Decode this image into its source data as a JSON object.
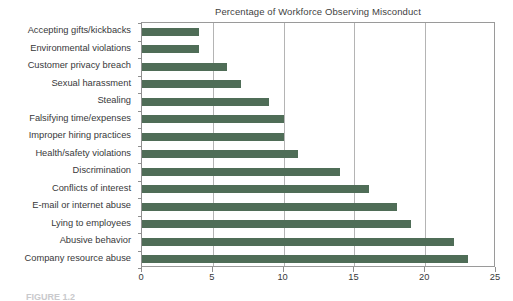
{
  "chart_data": {
    "type": "bar",
    "orientation": "horizontal",
    "title": "Percentage of Workforce Observing Misconduct",
    "xlabel": "",
    "ylabel": "",
    "xlim": [
      0,
      25
    ],
    "xticks": [
      0,
      5,
      10,
      15,
      20,
      25
    ],
    "xtick_labels": [
      "0",
      "5",
      "10",
      "15",
      "20",
      "25"
    ],
    "grid": "vertical",
    "legend": "none",
    "bar_color": "#4f6d57",
    "categories": [
      "Accepting gifts/kickbacks",
      "Environmental violations",
      "Customer privacy breach",
      "Sexual harassment",
      "Stealing",
      "Falsifying time/expenses",
      "Improper hiring practices",
      "Health/safety violations",
      "Discrimination",
      "Conflicts of interest",
      "E-mail or internet abuse",
      "Lying to employees",
      "Abusive behavior",
      "Company resource abuse"
    ],
    "values": [
      4,
      4,
      6,
      7,
      9,
      10,
      10,
      11,
      14,
      16,
      18,
      19,
      22,
      23
    ]
  },
  "caption": {
    "text": "FIGURE 1.2"
  },
  "colors": {
    "bar": "#4f6d57",
    "gridline": "#b4b4b4",
    "axis": "#8f8f8f",
    "text": "#38383a"
  }
}
